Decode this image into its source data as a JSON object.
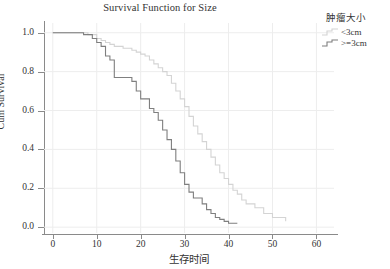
{
  "chart_data": {
    "type": "line",
    "title": "Survival Function for Size",
    "xlabel": "生存时间",
    "ylabel": "Cum Survival",
    "xlim": [
      -2,
      64
    ],
    "ylim": [
      -0.03,
      1.05
    ],
    "xticks": [
      "0",
      "10",
      "20",
      "30",
      "40",
      "50",
      "60"
    ],
    "xtick_values": [
      0,
      10,
      20,
      30,
      40,
      50,
      60
    ],
    "yticks": [
      "0.0",
      "0.2",
      "0.4",
      "0.6",
      "0.8",
      "1.0"
    ],
    "ytick_values": [
      0.0,
      0.2,
      0.4,
      0.6,
      0.8,
      1.0
    ],
    "grid": true,
    "legend": {
      "title": "肿瘤大小",
      "position": "right-top",
      "entries": [
        {
          "label": "<3cm",
          "color": "#d4d4d4"
        },
        {
          "label": ">=3cm",
          "color": "#7f7f7f"
        }
      ]
    },
    "series": [
      {
        "name": "<3cm",
        "color": "#d4d4d4",
        "step": "post",
        "x": [
          0,
          6,
          8,
          10,
          11,
          12,
          13,
          14,
          16,
          18,
          19,
          20,
          21,
          22,
          23,
          24,
          25,
          26,
          27,
          28,
          29,
          30,
          31,
          32,
          33,
          34,
          35,
          36,
          37,
          38,
          39,
          40,
          41,
          42,
          43,
          44,
          46,
          48,
          50,
          53
        ],
        "y": [
          1.0,
          1.0,
          0.99,
          0.97,
          0.96,
          0.95,
          0.94,
          0.93,
          0.92,
          0.91,
          0.9,
          0.89,
          0.88,
          0.86,
          0.84,
          0.82,
          0.8,
          0.78,
          0.74,
          0.7,
          0.66,
          0.62,
          0.57,
          0.52,
          0.48,
          0.44,
          0.4,
          0.36,
          0.32,
          0.28,
          0.25,
          0.22,
          0.19,
          0.17,
          0.14,
          0.12,
          0.1,
          0.07,
          0.05,
          0.03
        ]
      },
      {
        "name": ">=3cm",
        "color": "#7f7f7f",
        "step": "post",
        "x": [
          0,
          5,
          7,
          9,
          10,
          11,
          12,
          13,
          14,
          16,
          18,
          19,
          20,
          21,
          22,
          23,
          24,
          25,
          26,
          27,
          28,
          29,
          30,
          31,
          32,
          33,
          34,
          35,
          36,
          37,
          38,
          39,
          40,
          41,
          42
        ],
        "y": [
          1.0,
          1.0,
          0.99,
          0.97,
          0.95,
          0.93,
          0.88,
          0.86,
          0.77,
          0.77,
          0.75,
          0.7,
          0.66,
          0.66,
          0.61,
          0.59,
          0.55,
          0.5,
          0.45,
          0.4,
          0.34,
          0.28,
          0.22,
          0.18,
          0.15,
          0.15,
          0.12,
          0.09,
          0.07,
          0.05,
          0.04,
          0.03,
          0.02,
          0.02,
          0.02
        ]
      }
    ]
  }
}
